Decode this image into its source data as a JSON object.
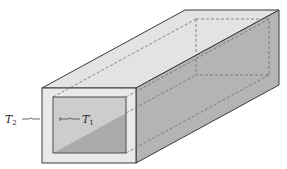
{
  "figure": {
    "labels": {
      "outer_temperature": {
        "base": "T",
        "subscript": "2"
      },
      "inner_temperature": {
        "base": "T",
        "subscript": "1"
      }
    },
    "colors": {
      "background": "#ffffff",
      "top_face": "#e3e3e3",
      "right_face": "#b4b4b4",
      "front_frame": "#e9e9e9",
      "inner_upper": "#cdcdcd",
      "inner_lower": "#ababab",
      "edge": "#3a3a3a",
      "dashed": "#6e6e6e"
    }
  }
}
